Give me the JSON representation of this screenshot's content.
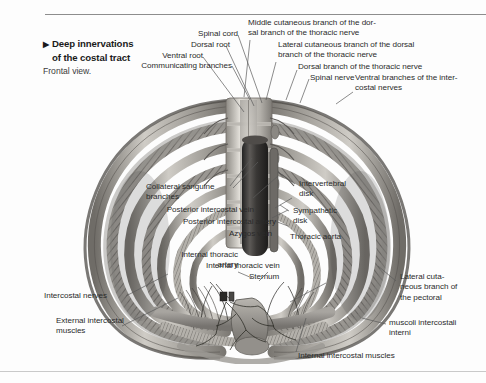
{
  "figure": {
    "title_arrow": "▶",
    "title_line1": "Deep innervations",
    "title_line2": "of the costal tract",
    "subtitle": "Frontal view.",
    "view_kind": "anatomical-illustration",
    "palette": {
      "page_background": "#fdfdfd",
      "label_text": "#2b2b2b",
      "title_text": "#1a1a1a",
      "leader_line": "#5a5a5a",
      "rule_top": "#8d8d8d",
      "rule_bottom": "#c9c9c9",
      "illustration_light": "#e8e6e1",
      "illustration_mid": "#a9a6a0",
      "illustration_dark": "#4a4a4a",
      "aorta_dark": "#3b3b3b"
    }
  },
  "labels": {
    "spinal_cord": "Spinal cord",
    "dorsal_root": "Dorsal root",
    "ventral_root": "Ventral root",
    "communicating_branches": "Communicating branches",
    "middle_cutaneous": "Middle cutaneous branch of the dor-\nsal branch of the thoracic nerve",
    "lateral_cutaneous_dorsal": "Lateral cutaneous branch of the dorsal\nbranch of the thoracic nerve",
    "dorsal_branch": "Dorsal branch of the thoracic nerve",
    "spinal_nerve": "Spinal nerve",
    "ventral_branches": "Ventral branches of the inter-\ncostal nerves",
    "collateral_sanguine": "Collateral sanguine\nbranches",
    "posterior_intercostal_vein": "Posterior intercostal vein",
    "posterior_intercostal_artery": "Posterior intercostal artery",
    "azygos_vein": "Azygos vein",
    "intervertebral_disk": "Intervertebral\ndisk",
    "sympathetic_disk": "Sympathetic\ndisk",
    "thoracic_aorta": "Thoracic aorta",
    "internal_thoracic_artery": "Internal thoracic\nartery",
    "internal_thoracic_vein": "Internal thoracic vein",
    "sternum": "Sternum",
    "intercostal_nerves": "Intercostal nerves",
    "external_intercostal_muscles": "External intercostal\nmuscles",
    "lateral_cutaneous_pectoral": "Lateral cuta-\nneous branch of\nthe pectoral",
    "muscoli_intercostali_interni": "muscoli intercostali\ninterni",
    "internal_intercostal_muscles": "Internal intercostal muscles"
  }
}
